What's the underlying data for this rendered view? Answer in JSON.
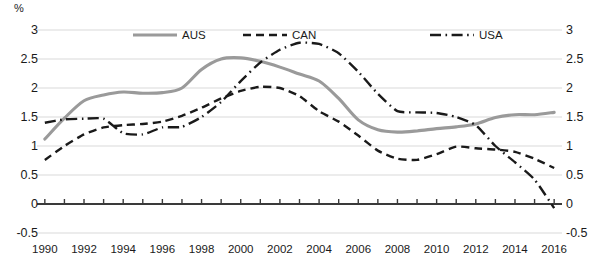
{
  "chart_data": {
    "type": "line",
    "title": "",
    "subtitle": "",
    "xlabel": "",
    "ylabel": "",
    "unit_label": "%",
    "x": [
      1990,
      1991,
      1992,
      1993,
      1994,
      1995,
      1996,
      1997,
      1998,
      1999,
      2000,
      2001,
      2002,
      2003,
      2004,
      2005,
      2006,
      2007,
      2008,
      2009,
      2010,
      2011,
      2012,
      2013,
      2014,
      2015,
      2016
    ],
    "xlim": [
      1989.6,
      2016.4
    ],
    "ylim": [
      -0.5,
      3
    ],
    "yticks": [
      -0.5,
      0,
      0.5,
      1,
      1.5,
      2,
      2.5,
      3
    ],
    "ytick_labels": [
      "-0.5",
      "0",
      "0.5",
      "1",
      "1.5",
      "2",
      "2.5",
      "3"
    ],
    "xticks": [
      1990,
      1992,
      1994,
      1996,
      1998,
      2000,
      2002,
      2004,
      2006,
      2008,
      2010,
      2012,
      2014,
      2016
    ],
    "xtick_labels": [
      "1990",
      "1992",
      "1994",
      "1996",
      "1998",
      "2000",
      "2002",
      "2004",
      "2006",
      "2008",
      "2010",
      "2012",
      "2014",
      "2016"
    ],
    "grid": true,
    "grid_color": "#d9d9d9",
    "axis_color": "#3a3a3a",
    "legend_position": "top",
    "series": [
      {
        "name": "AUS",
        "style": "solid",
        "color": "#9a9a9a",
        "width": 3.1,
        "values": [
          1.12,
          1.48,
          1.78,
          1.88,
          1.93,
          1.91,
          1.92,
          2.0,
          2.32,
          2.5,
          2.52,
          2.46,
          2.36,
          2.24,
          2.12,
          1.82,
          1.45,
          1.28,
          1.24,
          1.26,
          1.3,
          1.33,
          1.38,
          1.49,
          1.54,
          1.54,
          1.58
        ]
      },
      {
        "name": "CAN",
        "style": "dashed",
        "color": "#1a1a1a",
        "width": 2.4,
        "values": [
          0.76,
          1.0,
          1.2,
          1.32,
          1.36,
          1.38,
          1.42,
          1.52,
          1.66,
          1.82,
          1.95,
          2.02,
          2.0,
          1.86,
          1.6,
          1.42,
          1.18,
          0.92,
          0.78,
          0.76,
          0.86,
          0.99,
          0.96,
          0.94,
          0.9,
          0.78,
          0.62
        ]
      },
      {
        "name": "USA",
        "style": "dashdot",
        "color": "#1a1a1a",
        "width": 2.4,
        "values": [
          1.4,
          1.46,
          1.47,
          1.47,
          1.22,
          1.2,
          1.32,
          1.33,
          1.5,
          1.76,
          2.12,
          2.44,
          2.66,
          2.78,
          2.76,
          2.6,
          2.28,
          1.9,
          1.6,
          1.58,
          1.57,
          1.5,
          1.36,
          1.0,
          0.72,
          0.42,
          -0.07
        ]
      }
    ],
    "legend": [
      {
        "label": "AUS",
        "style": "solid",
        "color": "#9a9a9a"
      },
      {
        "label": "CAN",
        "style": "dashed",
        "color": "#1a1a1a"
      },
      {
        "label": "USA",
        "style": "dashdot",
        "color": "#1a1a1a"
      }
    ]
  }
}
